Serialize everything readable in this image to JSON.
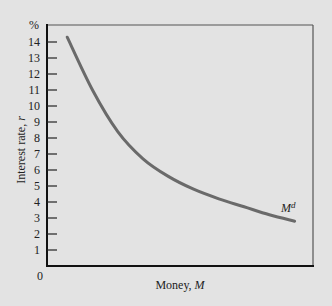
{
  "chart_data": {
    "type": "line",
    "title": "",
    "xlabel": "Money, M",
    "xlabel_parts": {
      "text": "Money, ",
      "var": "M"
    },
    "ylabel": "Interest rate, r",
    "ylabel_parts": {
      "text": "Interest rate, ",
      "var": "r"
    },
    "y_unit_label": "%",
    "x_origin_label": "0",
    "ylim": [
      0,
      14.5
    ],
    "yticks": [
      1,
      2,
      3,
      4,
      5,
      6,
      7,
      8,
      9,
      10,
      11,
      12,
      13,
      14
    ],
    "xticks": [],
    "grid": false,
    "legend": "none",
    "series": [
      {
        "name": "Md",
        "label_base": "M",
        "label_sup": "d",
        "color": "#6a6a6a",
        "x_relative": [
          0.08,
          0.18,
          0.28,
          0.38,
          0.48,
          0.58,
          0.68,
          0.78,
          0.88,
          0.98
        ],
        "values": [
          14.3,
          11.0,
          8.4,
          6.7,
          5.6,
          4.8,
          4.2,
          3.7,
          3.2,
          2.8
        ]
      }
    ]
  },
  "axes": {
    "y_tick_labels": [
      "1",
      "2",
      "3",
      "4",
      "5",
      "6",
      "7",
      "8",
      "9",
      "10",
      "11",
      "12",
      "13",
      "14"
    ]
  }
}
